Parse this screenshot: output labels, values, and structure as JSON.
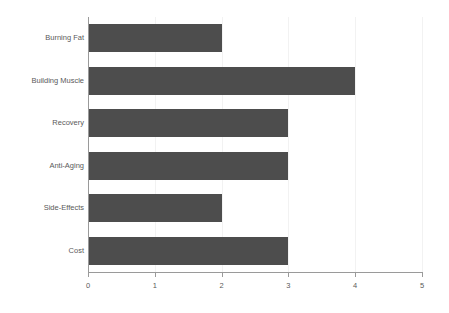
{
  "chart_data": {
    "type": "bar",
    "orientation": "horizontal",
    "title": "",
    "subtitle": "",
    "xlabel": "",
    "ylabel": "",
    "categories": [
      "Burning Fat",
      "Building Muscle",
      "Recovery",
      "Anti-Aging",
      "Side-Effects",
      "Cost"
    ],
    "values": [
      2,
      4,
      3,
      3,
      2,
      3
    ],
    "xlim": [
      0,
      5
    ],
    "xticks": [
      "0",
      "1",
      "2",
      "3",
      "4",
      "5"
    ],
    "xtick_values": [
      0,
      1,
      2,
      3,
      4,
      5
    ],
    "grid": true,
    "grid_axis": "x",
    "legend": false,
    "legend_position": "none",
    "bar_color": "#4d4d4d",
    "grid_color": "#f2f2f2",
    "axis_color": "#9a9a9a",
    "label_color": "#5a5a5a",
    "background_color": "#ffffff"
  }
}
